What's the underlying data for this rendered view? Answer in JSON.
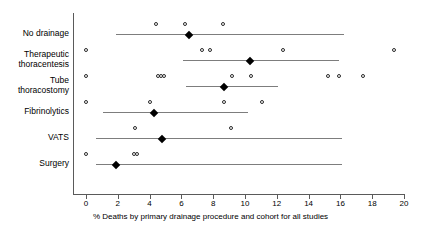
{
  "chart_data": {
    "type": "scatter",
    "title": "",
    "xlabel": "% Deaths by primary drainage procedure and cohort for all studies",
    "ylabel": "",
    "xlim": [
      0,
      20
    ],
    "xticks": [
      0,
      2,
      4,
      6,
      8,
      10,
      12,
      14,
      16,
      18,
      20
    ],
    "xtick_labels": [
      "0",
      "2",
      "4",
      "6",
      "8",
      "10",
      "12",
      "14",
      "16",
      "18",
      "20"
    ],
    "grid": false,
    "legend": "none",
    "orientation": "horizontal",
    "marker_open": "open-circle (individual cohort)",
    "marker_filled": "filled-diamond (pooled estimate)",
    "categories": [
      "No drainage",
      "Therapeutic thoracentesis",
      "Tube thoracostomy",
      "Fibrinolytics",
      "VATS",
      "Surgery"
    ],
    "rows": [
      {
        "label": "No drainage",
        "label_lines": [
          "No drainage"
        ],
        "pooled": 6.5,
        "ci": [
          1.9,
          16.2
        ],
        "points": [
          4.4,
          6.2,
          8.6
        ]
      },
      {
        "label": "Therapeutic thoracentesis",
        "label_lines": [
          "Therapeutic",
          "thoracentesis"
        ],
        "pooled": 10.3,
        "ci": [
          6.1,
          15.9
        ],
        "points": [
          0.0,
          7.3,
          7.8,
          12.4,
          19.4
        ]
      },
      {
        "label": "Tube thoracostomy",
        "label_lines": [
          "Tube",
          "thoracostomy"
        ],
        "pooled": 8.7,
        "ci": [
          6.3,
          12.1
        ],
        "points": [
          0.0,
          4.5,
          4.7,
          4.9,
          9.2,
          10.4,
          15.2,
          15.9,
          17.4
        ]
      },
      {
        "label": "Fibrinolytics",
        "label_lines": [
          "Fibrinolytics"
        ],
        "pooled": 4.3,
        "ci": [
          1.1,
          10.2
        ],
        "points": [
          0.0,
          4.0,
          8.7,
          11.1
        ]
      },
      {
        "label": "VATS",
        "label_lines": [
          "VATS"
        ],
        "pooled": 4.8,
        "ci": [
          0.6,
          16.1
        ],
        "points": [
          3.1,
          9.1
        ]
      },
      {
        "label": "Surgery",
        "label_lines": [
          "Surgery"
        ],
        "pooled": 1.9,
        "ci": [
          0.6,
          16.1
        ],
        "points": [
          0.0,
          3.0,
          3.2
        ]
      }
    ]
  },
  "colors": {
    "axis": "#5a5a5a",
    "line": "#7d7d7d",
    "marker_open_stroke": "#2b2b2b",
    "marker_filled": "#000000",
    "background": "#ffffff"
  }
}
